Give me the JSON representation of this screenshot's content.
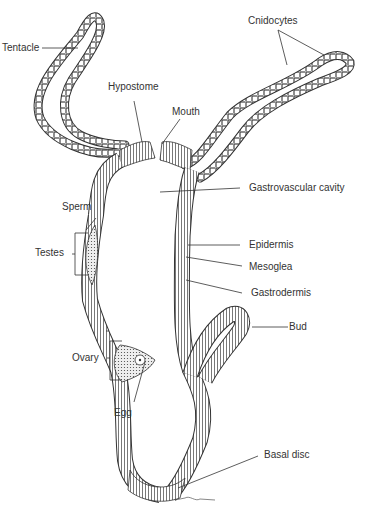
{
  "diagram": {
    "labels": {
      "tentacle": "Tentacle",
      "hypostome": "Hypostome",
      "mouth": "Mouth",
      "cnidocytes": "Cnidocytes",
      "gastrovascular_cavity": "Gastrovascular cavity",
      "sperm": "Sperm",
      "testes": "Testes",
      "epidermis": "Epidermis",
      "mesoglea": "Mesoglea",
      "gastrodermis": "Gastrodermis",
      "bud": "Bud",
      "ovary": "Ovary",
      "egg": "Egg",
      "basal_disc": "Basal disc"
    },
    "colors": {
      "line": "#333333",
      "fill": "#ffffff",
      "tissue_dark": "#555555",
      "tissue_light": "#bbbbbb"
    }
  }
}
